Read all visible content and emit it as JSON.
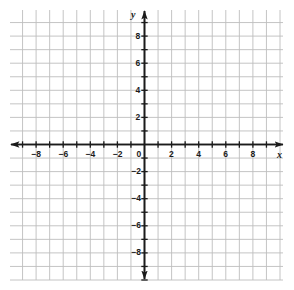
{
  "figure": {
    "kind": "cartesian-coordinate-grid",
    "background_color": "#ffffff",
    "grid_color": "#bdbdbd",
    "axis_color": "#1b1b1b",
    "label_color": "#1b1b1b"
  },
  "axes": {
    "x_axis_name": "x",
    "y_axis_name": "y",
    "origin_label": "0"
  },
  "chart_data": {
    "type": "scatter",
    "title": "",
    "xlabel": "x",
    "ylabel": "y",
    "grid": true,
    "legend": null,
    "series": [
      {
        "name": "",
        "x": [],
        "y": []
      }
    ],
    "xlim": [
      -10,
      10
    ],
    "ylim": [
      -10,
      10
    ],
    "x_tick_step": 2,
    "y_tick_step": 2,
    "x_minor_step": 1,
    "y_minor_step": 1,
    "x_tick_labels": [
      "−8",
      "−6",
      "−4",
      "−2",
      "0",
      "2",
      "4",
      "6",
      "8"
    ],
    "x_tick_values": [
      -8,
      -6,
      -4,
      -2,
      0,
      2,
      4,
      6,
      8
    ],
    "y_tick_labels": [
      "8",
      "6",
      "4",
      "2",
      "−2",
      "−4",
      "−6",
      "−8"
    ],
    "y_tick_values": [
      8,
      6,
      4,
      2,
      -2,
      -4,
      -6,
      -8
    ],
    "annotations": []
  },
  "x_labels": [
    {
      "text": "−8",
      "value": -8
    },
    {
      "text": "−6",
      "value": -6
    },
    {
      "text": "−4",
      "value": -4
    },
    {
      "text": "−2",
      "value": -2
    },
    {
      "text": "0",
      "value": 0
    },
    {
      "text": "2",
      "value": 2
    },
    {
      "text": "4",
      "value": 4
    },
    {
      "text": "6",
      "value": 6
    },
    {
      "text": "8",
      "value": 8
    }
  ],
  "y_labels": [
    {
      "text": "8",
      "value": 8
    },
    {
      "text": "6",
      "value": 6
    },
    {
      "text": "4",
      "value": 4
    },
    {
      "text": "2",
      "value": 2
    },
    {
      "text": "−2",
      "value": -2
    },
    {
      "text": "−4",
      "value": -4
    },
    {
      "text": "−6",
      "value": -6
    },
    {
      "text": "−8",
      "value": -8
    }
  ]
}
